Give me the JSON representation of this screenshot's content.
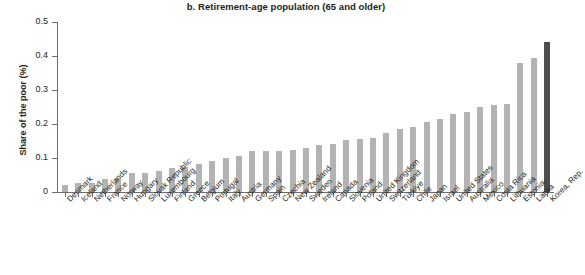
{
  "chart_data": {
    "type": "bar",
    "title": "b. Retirement-age population (65 and older)",
    "xlabel": "",
    "ylabel": "Share of the poor (%)",
    "ylim": [
      0,
      0.5
    ],
    "ytick_labels": [
      "0",
      "0.1",
      "0.2",
      "0.3",
      "0.4",
      "0.5"
    ],
    "ytick_values": [
      0,
      0.1,
      0.2,
      0.3,
      0.4,
      0.5
    ],
    "grid": false,
    "legend": "none",
    "bar_color": "#b3b3b3",
    "highlight_color": "#4d4d4d",
    "highlight_category": "Korea, Rep.",
    "categories": [
      "Denmark",
      "Iceland",
      "Netherlands",
      "France",
      "Norway",
      "Hungary",
      "Slovak Republic",
      "Luxembourg",
      "Finland",
      "Greece",
      "Belgium",
      "Portugal",
      "Italy",
      "Austria",
      "Germany",
      "Spain",
      "Czechia",
      "New Zealand",
      "Sweden",
      "Ireland",
      "Canada",
      "Slovenia",
      "Poland",
      "United Kingdom",
      "Switzerland",
      "Türkiye",
      "Chile",
      "Japan",
      "Israel",
      "United States",
      "Australia",
      "Mexico",
      "Costa Rica",
      "Lithuania",
      "Estonia",
      "Latvia",
      "Korea, Rep."
    ],
    "values": [
      0.022,
      0.027,
      0.027,
      0.037,
      0.04,
      0.055,
      0.057,
      0.062,
      0.072,
      0.075,
      0.082,
      0.09,
      0.1,
      0.105,
      0.12,
      0.12,
      0.122,
      0.125,
      0.13,
      0.138,
      0.14,
      0.152,
      0.155,
      0.16,
      0.175,
      0.185,
      0.19,
      0.205,
      0.215,
      0.228,
      0.235,
      0.25,
      0.255,
      0.258,
      0.378,
      0.395,
      0.44
    ]
  }
}
